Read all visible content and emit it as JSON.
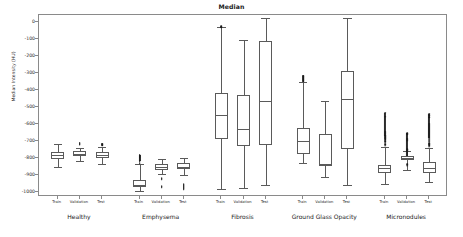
{
  "chart_data": {
    "type": "box",
    "title": "Median",
    "xlabel": "",
    "ylabel": "Median Intensity (HU)",
    "ylim": [
      -1030,
      40
    ],
    "yticks": [
      0,
      -100,
      -200,
      -300,
      -400,
      -500,
      -600,
      -700,
      -800,
      -900,
      -1000
    ],
    "ytick_labels": [
      "0",
      "-100",
      "-200",
      "-300",
      "-400",
      "-500",
      "-600",
      "-700",
      "-800",
      "-900",
      "-1000"
    ],
    "grid": false,
    "legend": "none",
    "groups": [
      "Healthy",
      "Emphysema",
      "Fibrosis",
      "Ground Glass Opacity",
      "Micronodules"
    ],
    "splits": [
      "Train",
      "Validation",
      "Test"
    ],
    "boxes": [
      {
        "group": "Healthy",
        "split": "Train",
        "whisker_low": -855,
        "q1": -805,
        "median": -785,
        "q3": -768,
        "whisker_high": -718,
        "outliers": []
      },
      {
        "group": "Healthy",
        "split": "Validation",
        "whisker_low": -820,
        "q1": -790,
        "median": -775,
        "q3": -762,
        "whisker_high": -742,
        "outliers": [
          -722,
          -718,
          -714,
          -710
        ]
      },
      {
        "group": "Healthy",
        "split": "Test",
        "whisker_low": -838,
        "q1": -800,
        "median": -785,
        "q3": -765,
        "whisker_high": -735,
        "outliers": [
          -726,
          -720,
          -716
        ]
      },
      {
        "group": "Emphysema",
        "split": "Train",
        "whisker_low": -995,
        "q1": -972,
        "median": -958,
        "q3": -930,
        "whisker_high": -838,
        "outliers": [
          -830,
          -820,
          -812,
          -806,
          -800,
          -795,
          -790,
          -786,
          -782
        ]
      },
      {
        "group": "Emphysema",
        "split": "Validation",
        "whisker_low": -895,
        "q1": -870,
        "median": -855,
        "q3": -838,
        "whisker_high": -805,
        "outliers": [
          -920,
          -925,
          -968,
          -972
        ]
      },
      {
        "group": "Emphysema",
        "split": "Test",
        "whisker_low": -900,
        "q1": -868,
        "median": -852,
        "q3": -832,
        "whisker_high": -800,
        "outliers": [
          -955,
          -962,
          -968,
          -972,
          -978,
          -984
        ]
      },
      {
        "group": "Fibrosis",
        "split": "Train",
        "whisker_low": -982,
        "q1": -688,
        "median": -548,
        "q3": -418,
        "whisker_high": -32,
        "outliers": [
          -30,
          -26
        ]
      },
      {
        "group": "Fibrosis",
        "split": "Validation",
        "whisker_low": -978,
        "q1": -732,
        "median": -632,
        "q3": -428,
        "whisker_high": -105,
        "outliers": []
      },
      {
        "group": "Fibrosis",
        "split": "Test",
        "whisker_low": -958,
        "q1": -725,
        "median": -468,
        "q3": -112,
        "whisker_high": 25,
        "outliers": []
      },
      {
        "group": "Ground Glass Opacity",
        "split": "Train",
        "whisker_low": -828,
        "q1": -780,
        "median": -702,
        "q3": -622,
        "whisker_high": -352,
        "outliers": [
          -348,
          -342,
          -336,
          -330,
          -325,
          -320,
          -318
        ]
      },
      {
        "group": "Ground Glass Opacity",
        "split": "Validation",
        "whisker_low": -912,
        "q1": -848,
        "median": -838,
        "q3": -658,
        "whisker_high": -468,
        "outliers": []
      },
      {
        "group": "Ground Glass Opacity",
        "split": "Test",
        "whisker_low": -958,
        "q1": -748,
        "median": -452,
        "q3": -288,
        "whisker_high": 24,
        "outliers": []
      },
      {
        "group": "Micronodules",
        "split": "Train",
        "whisker_low": -952,
        "q1": -888,
        "median": -862,
        "q3": -840,
        "whisker_high": -735,
        "outliers": [
          -728,
          -718,
          -710,
          -702,
          -698,
          -690,
          -684,
          -678,
          -672,
          -665,
          -658,
          -652,
          -646,
          -558,
          -535
        ]
      },
      {
        "group": "Micronodules",
        "split": "Validation",
        "whisker_low": -872,
        "q1": -812,
        "median": -798,
        "q3": -788,
        "whisker_high": -762,
        "outliers": [
          -845,
          -838,
          -756,
          -748,
          -700,
          -694,
          -688,
          -660,
          -655
        ]
      },
      {
        "group": "Micronodules",
        "split": "Test",
        "whisker_low": -942,
        "q1": -888,
        "median": -862,
        "q3": -822,
        "whisker_high": -742,
        "outliers": [
          -735,
          -726,
          -718,
          -712,
          -706,
          -700,
          -694,
          -688,
          -682,
          -676,
          -670,
          -664,
          -658,
          -652,
          -646,
          -640,
          -634,
          -628,
          -622,
          -616,
          -610,
          -604,
          -598,
          -560,
          -548,
          -540
        ]
      }
    ]
  },
  "style": {
    "line_color": "#5a5a5a",
    "frame_color": "#8a8a8a",
    "text_color": "#2b2b2b",
    "marker_color": "#1a1a1a",
    "background": "#ffffff"
  }
}
